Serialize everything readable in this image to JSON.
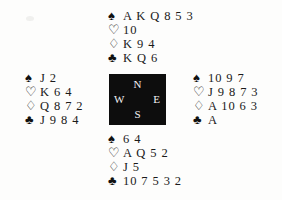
{
  "diagram": {
    "background_color": "#fdfdfc",
    "text_color": "#1a1a1a"
  },
  "suit_symbols": {
    "spade": "♠",
    "heart": "♡",
    "diamond": "♢",
    "club": "♣"
  },
  "compass": {
    "background_color": "#0d0d0d",
    "text_color": "#f4f4f4",
    "north": "N",
    "west": "W",
    "east": "E",
    "south": "S"
  },
  "hands": {
    "north": {
      "label": "North",
      "spades": "A K Q 8 5 3",
      "hearts": "10",
      "diamonds": "K 9 4",
      "clubs": "K Q 6"
    },
    "west": {
      "label": "West",
      "spades": "J 2",
      "hearts": "K 6 4",
      "diamonds": "Q 8 7 2",
      "clubs": "J 9 8 4"
    },
    "east": {
      "label": "East",
      "spades": "10 9 7",
      "hearts": "J 9 8 7 3",
      "diamonds": "A 10 6 3",
      "clubs": "A"
    },
    "south": {
      "label": "South",
      "spades": "6 4",
      "hearts": "A Q 5 2",
      "diamonds": "J 5",
      "clubs": "10 7 5 3 2"
    }
  }
}
